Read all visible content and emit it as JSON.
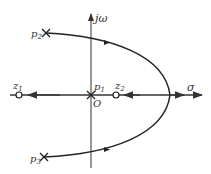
{
  "labels": {
    "imag_axis": "jω",
    "real_axis": "σ",
    "origin": "O",
    "p1": "p",
    "p1_sub": "1",
    "p2": "p",
    "p2_sub": "2",
    "p3": "p",
    "p3_sub": "3",
    "z1": "z",
    "z1_sub": "1",
    "z2": "z",
    "z2_sub": "2"
  },
  "colors": {
    "line": "#333333",
    "background": "#ffffff"
  }
}
